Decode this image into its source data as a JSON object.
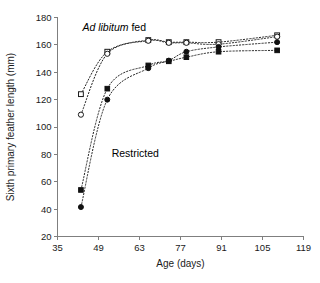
{
  "chart_data": {
    "type": "scatter",
    "title": "",
    "xlabel": "Age (days)",
    "ylabel": "Sixth primary feather length (mm)",
    "xlim": [
      35,
      119
    ],
    "ylim": [
      20,
      180
    ],
    "xticks": [
      35,
      49,
      63,
      77,
      91,
      105,
      119
    ],
    "yticks": [
      20,
      40,
      60,
      80,
      100,
      120,
      140,
      160,
      180
    ],
    "xtick_labels": [
      "35",
      "49",
      "63",
      "77",
      "91",
      "105",
      "119"
    ],
    "ytick_labels": [
      "20",
      "40",
      "60",
      "80",
      "100",
      "120",
      "140",
      "160",
      "180"
    ],
    "grid": false,
    "legend": "none",
    "annotations": [
      {
        "name": "ad-libitum-label",
        "text_italic": "Ad libitum",
        "text_plain": " fed",
        "x": 43.5,
        "y": 170
      },
      {
        "name": "restricted-label",
        "text_italic": "",
        "text_plain": "Restricted",
        "x": 53.5,
        "y": 78
      }
    ],
    "series": [
      {
        "name": "Ad libitum fed - group 1",
        "marker": "open-square",
        "line": "dotted",
        "x": [
          43,
          52,
          66,
          73,
          79,
          90,
          110
        ],
        "y": [
          124,
          155,
          163.5,
          162,
          162,
          162,
          167
        ]
      },
      {
        "name": "Ad libitum fed - group 2",
        "marker": "open-circle",
        "line": "dotted",
        "x": [
          43,
          52,
          66,
          73,
          79,
          90,
          110
        ],
        "y": [
          109,
          153.5,
          163,
          161.5,
          161.5,
          160.5,
          166
        ]
      },
      {
        "name": "Restricted - group 1",
        "marker": "filled-square",
        "line": "dotted",
        "x": [
          43,
          52,
          66,
          73,
          79,
          90,
          110
        ],
        "y": [
          54,
          128,
          145,
          148,
          151,
          155,
          156
        ]
      },
      {
        "name": "Restricted - group 2",
        "marker": "filled-circle",
        "line": "dotted",
        "x": [
          43,
          52,
          66,
          73,
          79,
          90,
          110
        ],
        "y": [
          41.5,
          120,
          143,
          148.5,
          155,
          158.5,
          162
        ]
      }
    ]
  }
}
